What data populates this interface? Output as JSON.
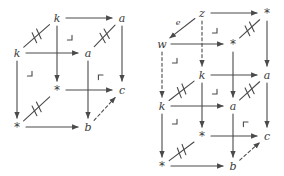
{
  "figure": {
    "stroke_color": "#4a4a4a",
    "label_color": "#3a3a3a",
    "background_color": "#ffffff",
    "width": 284,
    "height": 176
  },
  "diagrams": [
    {
      "id": "left-cube",
      "name": "left-commutative-cube",
      "nodes": [
        {
          "id": "L_k_back",
          "label": "k",
          "kind": "italic",
          "x": 57,
          "y": 18
        },
        {
          "id": "L_a_back",
          "label": "a",
          "kind": "italic",
          "x": 122,
          "y": 18
        },
        {
          "id": "L_k_front",
          "label": "k",
          "kind": "italic",
          "x": 17,
          "y": 53
        },
        {
          "id": "L_a_front",
          "label": "a",
          "kind": "italic",
          "x": 88,
          "y": 53
        },
        {
          "id": "L_s_back",
          "label": "*",
          "kind": "star",
          "x": 57,
          "y": 90
        },
        {
          "id": "L_c_back",
          "label": "c",
          "kind": "italic",
          "x": 122,
          "y": 90
        },
        {
          "id": "L_s_front",
          "label": "*",
          "kind": "star",
          "x": 17,
          "y": 127
        },
        {
          "id": "L_b_front",
          "label": "b",
          "kind": "italic",
          "x": 88,
          "y": 127
        }
      ],
      "edges": [
        {
          "from": "L_k_back",
          "to": "L_a_back",
          "style": "solid",
          "arrow": true
        },
        {
          "from": "L_k_front",
          "to": "L_a_front",
          "style": "solid",
          "arrow": true
        },
        {
          "from": "L_s_back",
          "to": "L_c_back",
          "style": "solid",
          "arrow": true
        },
        {
          "from": "L_s_front",
          "to": "L_b_front",
          "style": "solid",
          "arrow": true
        },
        {
          "from": "L_k_back",
          "to": "L_s_back",
          "style": "solid",
          "arrow": true
        },
        {
          "from": "L_a_back",
          "to": "L_c_back",
          "style": "solid",
          "arrow": true
        },
        {
          "from": "L_k_front",
          "to": "L_s_front",
          "style": "solid",
          "arrow": true
        },
        {
          "from": "L_a_front",
          "to": "L_b_front",
          "style": "solid",
          "arrow": true
        },
        {
          "from": "L_k_front",
          "to": "L_k_back",
          "style": "equal",
          "arrow": false
        },
        {
          "from": "L_a_front",
          "to": "L_a_back",
          "style": "equal",
          "arrow": false
        },
        {
          "from": "L_s_front",
          "to": "L_s_back",
          "style": "equal",
          "arrow": false
        },
        {
          "from": "L_b_front",
          "to": "L_c_back",
          "style": "dashed",
          "arrow": true
        }
      ],
      "corner_markers": [
        {
          "type": "pullback",
          "orientation": "bottom-right",
          "x": 72,
          "y": 40
        },
        {
          "type": "pullback",
          "orientation": "bottom-right",
          "x": 32,
          "y": 76
        },
        {
          "type": "pushout",
          "orientation": "top-left",
          "x": 103,
          "y": 75
        }
      ],
      "edge_labels": []
    },
    {
      "id": "right-cube",
      "name": "right-extended-commutative-cube",
      "nodes": [
        {
          "id": "R_z",
          "label": "z",
          "kind": "italic",
          "x": 202,
          "y": 13
        },
        {
          "id": "R_s_top",
          "label": "*",
          "kind": "star",
          "x": 267,
          "y": 13
        },
        {
          "id": "R_w",
          "label": "w",
          "kind": "italic",
          "x": 162,
          "y": 44
        },
        {
          "id": "R_s_mid",
          "label": "*",
          "kind": "star",
          "x": 233,
          "y": 44
        },
        {
          "id": "R_k_back",
          "label": "k",
          "kind": "italic",
          "x": 202,
          "y": 75
        },
        {
          "id": "R_a_back",
          "label": "a",
          "kind": "italic",
          "x": 267,
          "y": 75
        },
        {
          "id": "R_k_front",
          "label": "k",
          "kind": "italic",
          "x": 162,
          "y": 106
        },
        {
          "id": "R_a_front",
          "label": "a",
          "kind": "italic",
          "x": 233,
          "y": 106
        },
        {
          "id": "R_s_back",
          "label": "*",
          "kind": "star",
          "x": 202,
          "y": 136
        },
        {
          "id": "R_c_back",
          "label": "c",
          "kind": "italic",
          "x": 267,
          "y": 136
        },
        {
          "id": "R_s_front",
          "label": "*",
          "kind": "star",
          "x": 162,
          "y": 166
        },
        {
          "id": "R_b_front",
          "label": "b",
          "kind": "italic",
          "x": 233,
          "y": 166
        }
      ],
      "edges": [
        {
          "from": "R_z",
          "to": "R_s_top",
          "style": "solid",
          "arrow": true
        },
        {
          "from": "R_w",
          "to": "R_s_mid",
          "style": "solid",
          "arrow": true
        },
        {
          "from": "R_k_back",
          "to": "R_a_back",
          "style": "solid",
          "arrow": true
        },
        {
          "from": "R_k_front",
          "to": "R_a_front",
          "style": "solid",
          "arrow": true
        },
        {
          "from": "R_s_back",
          "to": "R_c_back",
          "style": "solid",
          "arrow": true
        },
        {
          "from": "R_s_front",
          "to": "R_b_front",
          "style": "solid",
          "arrow": true
        },
        {
          "from": "R_z",
          "to": "R_k_back",
          "style": "dashed",
          "arrow": true
        },
        {
          "from": "R_w",
          "to": "R_k_front",
          "style": "dashed",
          "arrow": true
        },
        {
          "from": "R_s_top",
          "to": "R_a_back",
          "style": "solid",
          "arrow": true
        },
        {
          "from": "R_s_mid",
          "to": "R_a_front",
          "style": "solid",
          "arrow": true
        },
        {
          "from": "R_k_back",
          "to": "R_s_back",
          "style": "solid",
          "arrow": true
        },
        {
          "from": "R_a_back",
          "to": "R_c_back",
          "style": "solid",
          "arrow": true
        },
        {
          "from": "R_k_front",
          "to": "R_s_front",
          "style": "solid",
          "arrow": true
        },
        {
          "from": "R_a_front",
          "to": "R_b_front",
          "style": "solid",
          "arrow": true
        },
        {
          "from": "R_z",
          "to": "R_w",
          "style": "solid",
          "arrow": true,
          "label": "e"
        },
        {
          "from": "R_s_mid",
          "to": "R_s_top",
          "style": "equal",
          "arrow": false
        },
        {
          "from": "R_k_front",
          "to": "R_k_back",
          "style": "equal",
          "arrow": false
        },
        {
          "from": "R_a_front",
          "to": "R_a_back",
          "style": "equal",
          "arrow": false
        },
        {
          "from": "R_s_front",
          "to": "R_s_back",
          "style": "equal",
          "arrow": false
        },
        {
          "from": "R_b_front",
          "to": "R_c_back",
          "style": "dashed",
          "arrow": true
        }
      ],
      "corner_markers": [
        {
          "type": "pullback",
          "orientation": "bottom-right",
          "x": 217,
          "y": 33
        },
        {
          "type": "pullback",
          "orientation": "bottom-right",
          "x": 177,
          "y": 63
        },
        {
          "type": "pullback",
          "orientation": "bottom-right",
          "x": 217,
          "y": 94
        },
        {
          "type": "pullback",
          "orientation": "bottom-right",
          "x": 177,
          "y": 124
        },
        {
          "type": "pushout",
          "orientation": "top-left",
          "x": 248,
          "y": 122
        }
      ],
      "edge_labels": [
        {
          "text": "e",
          "x": 178,
          "y": 22
        }
      ]
    }
  ]
}
